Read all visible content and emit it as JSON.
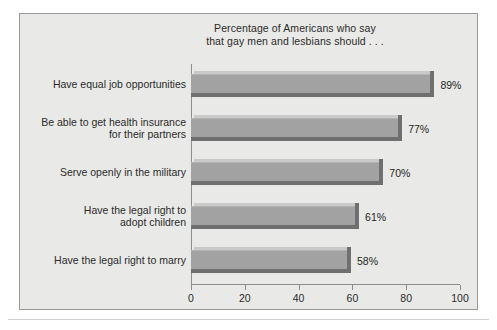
{
  "figure": {
    "background_color": "#ffffff",
    "panel_color": "#e9e9e7",
    "panel_border_color": "#9a9a9a",
    "bar_color": "#a2a2a2",
    "bar_shadow_color": "#6f6f6f",
    "axis_color": "#8d8d8d",
    "text_color": "#2b2b2b"
  },
  "title": {
    "line1": "Percentage of Americans who say",
    "line2": "that gay men and lesbians should . . ."
  },
  "chart_data": {
    "type": "bar",
    "orientation": "horizontal",
    "title": "Percentage of Americans who say that gay men and lesbians should . . .",
    "xlabel": "",
    "ylabel": "",
    "xlim": [
      0,
      100
    ],
    "xticks": [
      0,
      20,
      40,
      60,
      80,
      100
    ],
    "xtick_labels": [
      "0",
      "20",
      "40",
      "60",
      "80",
      "100"
    ],
    "grid": false,
    "legend": false,
    "categories": [
      "Have equal job opportunities",
      "Be able to get health insurance for their partners",
      "Serve openly in the military",
      "Have the legal right to adopt children",
      "Have the legal right to marry"
    ],
    "values": [
      89,
      77,
      70,
      61,
      58
    ],
    "data_labels": [
      "89%",
      "77%",
      "70%",
      "61%",
      "58%"
    ]
  },
  "categories": [
    {
      "lines": [
        "Have equal job opportunities"
      ],
      "value": 89,
      "label": "89%"
    },
    {
      "lines": [
        "Be able to get health insurance",
        "for their partners"
      ],
      "value": 77,
      "label": "77%"
    },
    {
      "lines": [
        "Serve openly in the military"
      ],
      "value": 70,
      "label": "70%"
    },
    {
      "lines": [
        "Have the legal right to",
        "adopt children"
      ],
      "value": 61,
      "label": "61%"
    },
    {
      "lines": [
        "Have the legal right to marry"
      ],
      "value": 58,
      "label": "58%"
    }
  ],
  "axis": {
    "ticks": [
      "0",
      "20",
      "40",
      "60",
      "80",
      "100"
    ]
  }
}
